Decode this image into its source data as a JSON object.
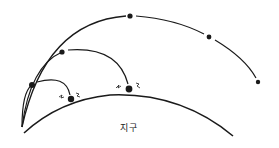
{
  "diagram": {
    "type": "projectile-orbit-illustration",
    "earth_label": "지구",
    "colors": {
      "line": "#1a1a1a",
      "background": "#ffffff"
    },
    "trajectories": [
      {
        "name": "short-trajectory",
        "outcome": "impact"
      },
      {
        "name": "medium-trajectory",
        "outcome": "impact"
      },
      {
        "name": "long-trajectory",
        "outcome": "continues"
      }
    ]
  }
}
